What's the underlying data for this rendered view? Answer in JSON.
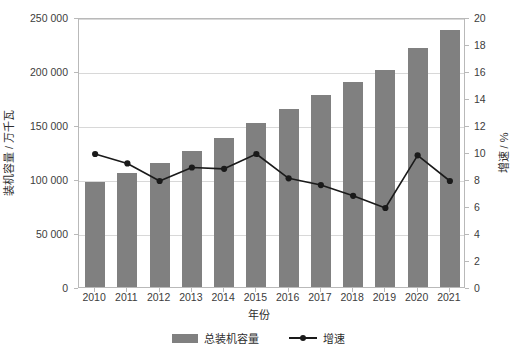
{
  "chart_data": {
    "type": "bar",
    "title": "",
    "xlabel": "年份",
    "ylabel": "装机容量 / 万千瓦",
    "ylabel_right": "增速 / %",
    "categories": [
      "2010",
      "2011",
      "2012",
      "2013",
      "2014",
      "2015",
      "2016",
      "2017",
      "2018",
      "2019",
      "2020",
      "2021"
    ],
    "ylim": [
      0,
      250000
    ],
    "ylim_right": [
      0,
      20
    ],
    "yticks": [
      0,
      50000,
      100000,
      150000,
      200000,
      250000
    ],
    "ytick_labels": [
      "0",
      "50 000",
      "100 000",
      "150 000",
      "200 000",
      "250 000"
    ],
    "yticks_right": [
      0,
      2,
      4,
      6,
      8,
      10,
      12,
      14,
      16,
      18,
      20
    ],
    "ytick_labels_right": [
      "0",
      "2",
      "4",
      "6",
      "8",
      "10",
      "12",
      "14",
      "16",
      "18",
      "20"
    ],
    "grid": true,
    "legend_position": "bottom",
    "series": [
      {
        "name": "总装机容量",
        "type": "bar",
        "axis": "left",
        "color": "#808080",
        "values": [
          97000,
          106000,
          115000,
          126000,
          138000,
          152000,
          165000,
          178000,
          190000,
          201000,
          221000,
          238000
        ]
      },
      {
        "name": "增速",
        "type": "line",
        "axis": "right",
        "color": "#1a1a1a",
        "marker": "circle",
        "values": [
          10.0,
          9.3,
          8.0,
          9.0,
          8.9,
          10.0,
          8.2,
          7.7,
          6.9,
          6.0,
          9.9,
          8.0
        ]
      }
    ]
  },
  "legend": {
    "bar_label": "总装机容量",
    "line_label": "增速"
  }
}
